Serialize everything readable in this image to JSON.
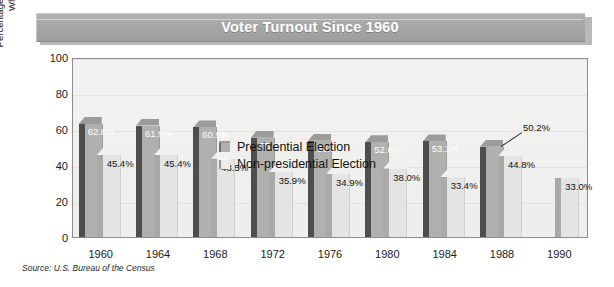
{
  "title": "Voter Turnout Since 1960",
  "source": "Source: U.S. Bureau of the Census",
  "legend": {
    "presidential": "Presidential Election",
    "nonpresidential": "Non-presidential Election"
  },
  "axis": {
    "y_title": "Percentage of Voting Age Population\nWho Actually Voted",
    "y_ticks": [
      "100",
      "80",
      "60",
      "40",
      "20",
      "0"
    ]
  },
  "chart_data": {
    "type": "bar",
    "title": "Voter Turnout Since 1960",
    "xlabel": "",
    "ylabel": "Percentage of Voting Age Population Who Actually Voted",
    "ylim": [
      0,
      100
    ],
    "yticks": [
      0,
      20,
      40,
      60,
      80,
      100
    ],
    "grid": true,
    "legend_position": "inside-top-center",
    "categories": [
      "1960",
      "1964",
      "1968",
      "1972",
      "1976",
      "1980",
      "1984",
      "1988",
      "1990"
    ],
    "series": [
      {
        "name": "Presidential Election",
        "color": "#b0b0ae",
        "values": [
          62.8,
          61.9,
          60.9,
          55.2,
          53.5,
          52.6,
          53.1,
          50.2,
          null
        ],
        "labels": [
          "62.8%",
          "61.9%",
          "60.9%",
          "55.2%",
          "53.5%",
          "52.6%",
          "53.1%",
          "50.2%",
          ""
        ]
      },
      {
        "name": "Non-presidential Election",
        "color": "#e4e4e2",
        "values": [
          45.4,
          45.4,
          43.5,
          35.9,
          34.9,
          38.0,
          33.4,
          44.8,
          33.0
        ],
        "labels": [
          "45.4%",
          "45.4%",
          "43.5%",
          "35.9%",
          "34.9%",
          "38.0%",
          "33.4%",
          "44.8%",
          "33.0%"
        ]
      }
    ],
    "annotations": [
      {
        "text": "50.2%",
        "target_series": "Presidential Election",
        "target_category": "1988",
        "leader_line": true
      }
    ],
    "source": "Source: U.S. Bureau of the Census"
  }
}
